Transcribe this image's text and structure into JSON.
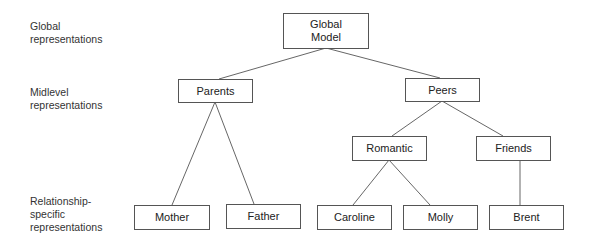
{
  "levels": [
    {
      "id": "global",
      "lines": [
        "Global",
        "representations"
      ]
    },
    {
      "id": "midlevel",
      "lines": [
        "Midlevel",
        "representations"
      ]
    },
    {
      "id": "relationship",
      "lines": [
        "Relationship-",
        "specific",
        "representations"
      ]
    }
  ],
  "nodes": {
    "global_model": {
      "lines": [
        "Global",
        "Model"
      ]
    },
    "parents": {
      "label": "Parents"
    },
    "peers": {
      "label": "Peers"
    },
    "romantic": {
      "label": "Romantic"
    },
    "friends": {
      "label": "Friends"
    },
    "mother": {
      "label": "Mother"
    },
    "father": {
      "label": "Father"
    },
    "caroline": {
      "label": "Caroline"
    },
    "molly": {
      "label": "Molly"
    },
    "brent": {
      "label": "Brent"
    }
  },
  "edges": [
    [
      "global_model",
      "parents"
    ],
    [
      "global_model",
      "peers"
    ],
    [
      "parents",
      "mother"
    ],
    [
      "parents",
      "father"
    ],
    [
      "peers",
      "romantic"
    ],
    [
      "peers",
      "friends"
    ],
    [
      "romantic",
      "caroline"
    ],
    [
      "romantic",
      "molly"
    ],
    [
      "friends",
      "brent"
    ]
  ]
}
